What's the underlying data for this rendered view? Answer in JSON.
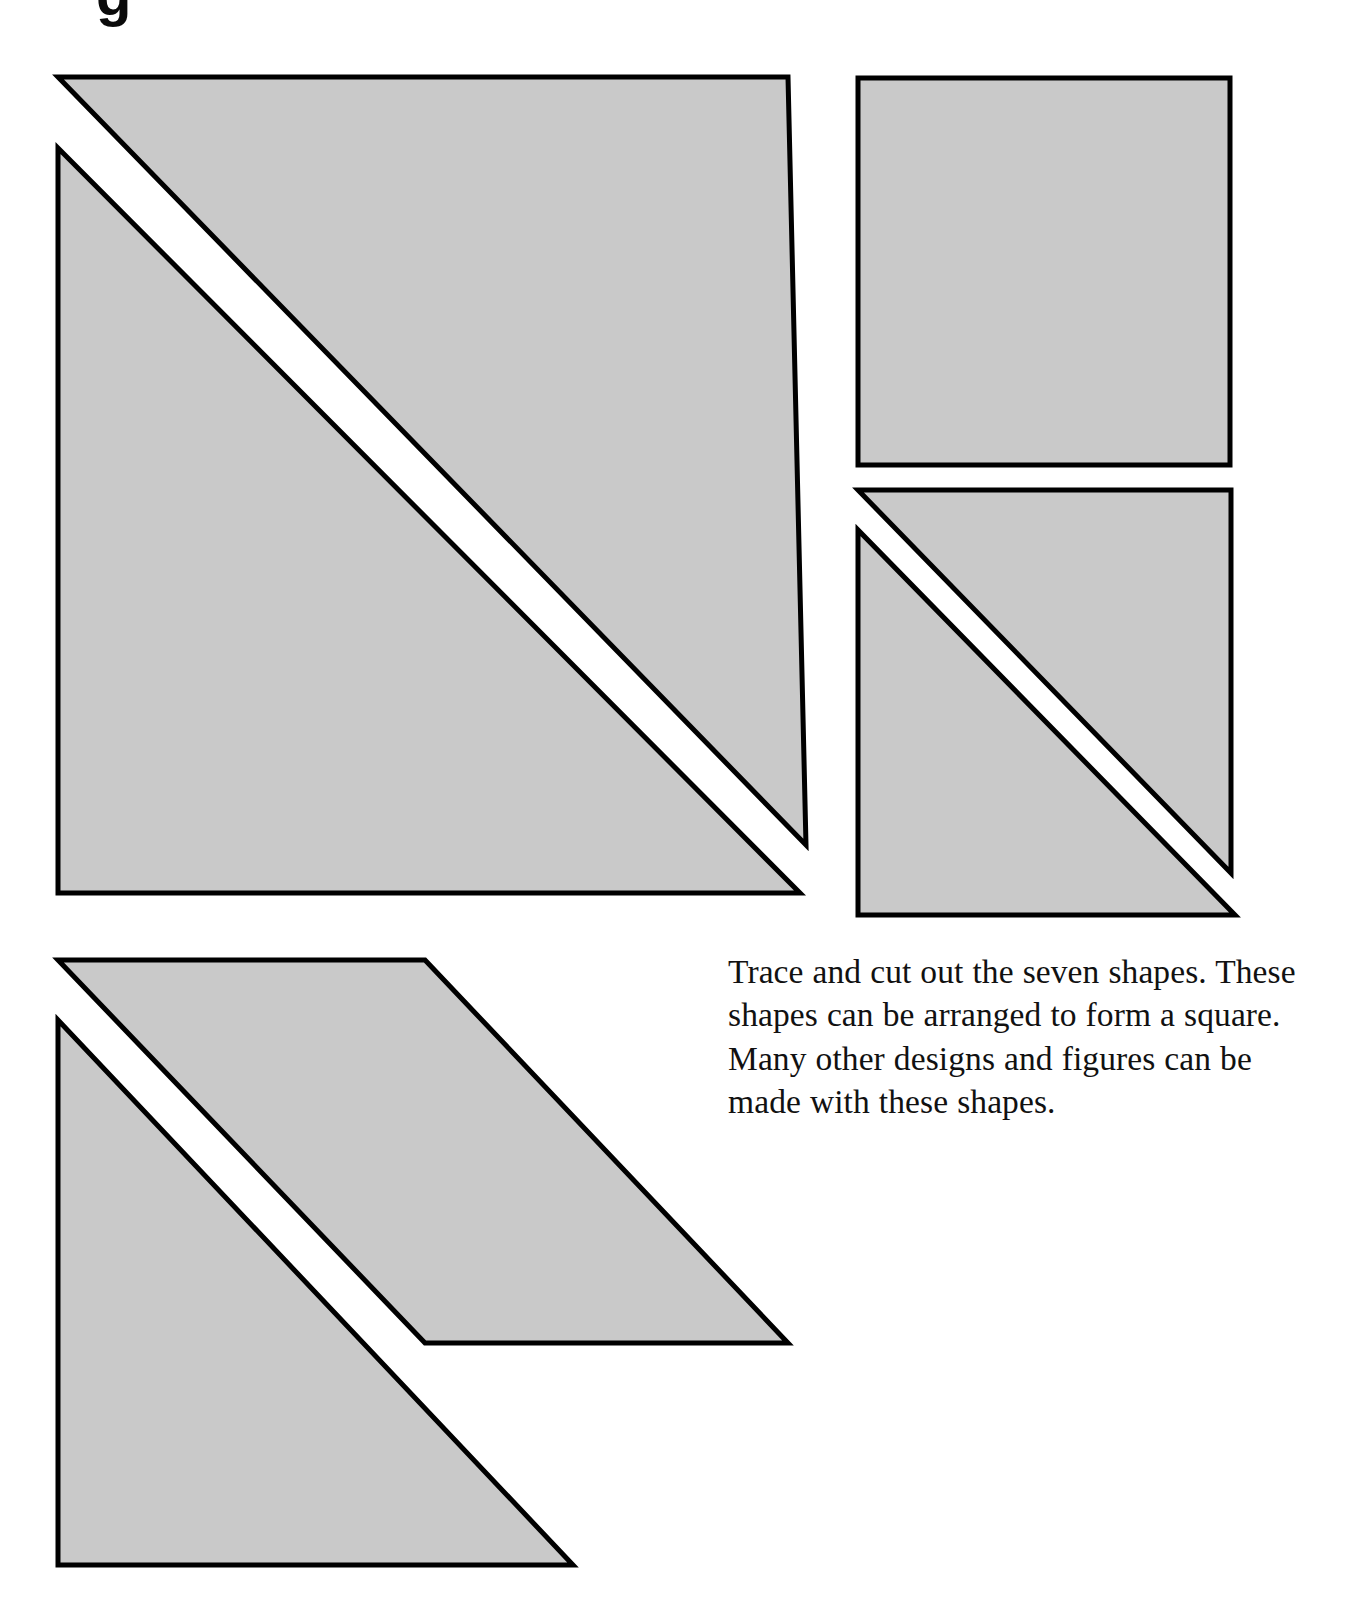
{
  "page": {
    "width": 1362,
    "height": 1610,
    "background_color": "#ffffff",
    "top_partial_glyph": "g"
  },
  "instructions": {
    "text": "Trace and cut out the seven shapes. These shapes can be arranged to form a square. Many other designs and figures can be made with these shapes."
  },
  "style": {
    "shape_fill": "#c9c9c9",
    "shape_stroke": "#000000",
    "stroke_width": 5
  },
  "shapes": [
    {
      "name": "large-triangle-upper",
      "kind": "triangle",
      "points": "58,77 788,77 806,845",
      "label": "Large right triangle (upper left group)"
    },
    {
      "name": "large-triangle-lower",
      "kind": "triangle",
      "points": "58,148 58,893 800,893",
      "label": "Large right triangle (lower left group)"
    },
    {
      "name": "square",
      "kind": "square",
      "points": "858,78 1230,78 1230,465 858,465",
      "label": "Square piece"
    },
    {
      "name": "medium-triangle-upper",
      "kind": "triangle",
      "points": "858,490 1231,490 1231,873",
      "label": "Medium right triangle (upper right group)"
    },
    {
      "name": "medium-triangle-lower",
      "kind": "triangle",
      "points": "858,530 858,915 1235,915",
      "label": "Medium right triangle (lower right group)"
    },
    {
      "name": "parallelogram",
      "kind": "parallelogram",
      "points": "58,960 425,960 788,1343 425,1343",
      "label": "Parallelogram piece"
    },
    {
      "name": "bottom-triangle",
      "kind": "triangle",
      "points": "58,1020 58,1565 573,1565",
      "label": "Right triangle (bottom left)"
    }
  ]
}
